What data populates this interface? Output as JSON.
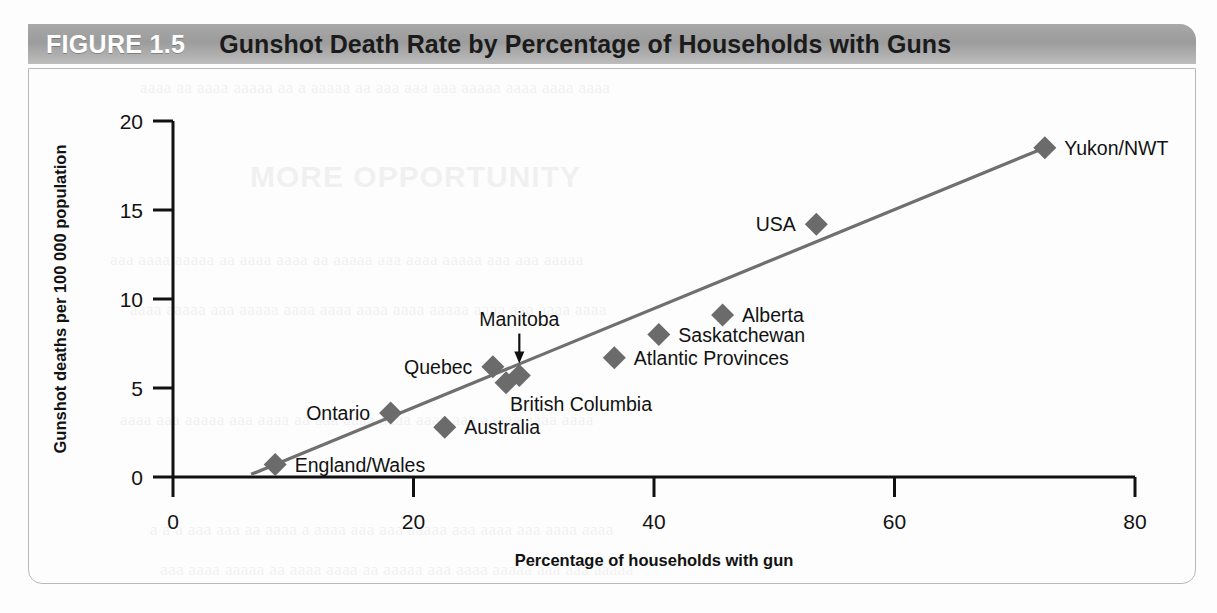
{
  "figure": {
    "number": "FIGURE 1.5",
    "title": "Gunshot Death Rate by Percentage of Households with Guns"
  },
  "colors": {
    "title_bar": "#a3a3a3",
    "figure_number_text": "#ffffff",
    "title_text": "#1b1b1b",
    "marker": "#6b6b6b",
    "trend_line": "#6f6f6f",
    "axis": "#111111",
    "panel_border": "#b9b9b9",
    "page_background": "#fdfdfd"
  },
  "chart_data": {
    "type": "scatter",
    "title": "Gunshot Death Rate by Percentage of Households with Guns",
    "xlabel": "Percentage of households with gun",
    "ylabel": "Gunshot deaths per 100 000 population",
    "xlim": [
      0,
      80
    ],
    "ylim": [
      0,
      20
    ],
    "xticks": [
      0,
      20,
      40,
      60,
      80
    ],
    "yticks": [
      0,
      5,
      10,
      15,
      20
    ],
    "xtick_labels": [
      "0",
      "20",
      "40",
      "60",
      "80"
    ],
    "ytick_labels": [
      "0",
      "5",
      "10",
      "15",
      "20"
    ],
    "grid": false,
    "legend": false,
    "points": [
      {
        "label": "England/Wales",
        "x": 8.5,
        "y": 0.7,
        "label_pos": "right"
      },
      {
        "label": "Ontario",
        "x": 18.1,
        "y": 3.6,
        "label_pos": "left"
      },
      {
        "label": "Australia",
        "x": 22.6,
        "y": 2.8,
        "label_pos": "right"
      },
      {
        "label": "Quebec",
        "x": 26.6,
        "y": 6.2,
        "label_pos": "left"
      },
      {
        "label": "British Columbia",
        "x": 27.7,
        "y": 5.3,
        "label_pos": "below-right"
      },
      {
        "label": "Manitoba",
        "x": 28.8,
        "y": 5.7,
        "label_pos": "above-arrow"
      },
      {
        "label": "Atlantic Provinces",
        "x": 36.7,
        "y": 6.7,
        "label_pos": "right"
      },
      {
        "label": "Saskatchewan",
        "x": 40.4,
        "y": 8.0,
        "label_pos": "right"
      },
      {
        "label": "Alberta",
        "x": 45.7,
        "y": 9.1,
        "label_pos": "right"
      },
      {
        "label": "USA",
        "x": 53.5,
        "y": 14.2,
        "label_pos": "left"
      },
      {
        "label": "Yukon/NWT",
        "x": 72.5,
        "y": 18.5,
        "label_pos": "right"
      }
    ],
    "trend_line": {
      "x0": 6.5,
      "y0": 0.15,
      "x1": 72.5,
      "y1": 18.5
    }
  },
  "ghost_text": {
    "heading": "MORE OPPORTUNITY",
    "lines": [
      "a a a aaa aaa aa aaaa a aaaa aaa aaa aaaaa aaa aaaa aaa aaaa aaaa",
      "aaaa aa aaaa aaaaa aa a aaaaa aa aaa aaa aaa aaaaa aaaa aaaa aaaa",
      "aaa aaaa aaaaa aa aaaa aaaa aa aaaaa aaa aaaa aaaaa aaa aaa aaaaa",
      "aaaa aaaaa aaa aaaaa aaaa aaaa aaaa aaaa aaaaa aaaa aaa aaaa aaaa",
      "aaaa aaa aaaaa aaa aaaa aa aaa aaaa aaaa aaaa aaa aaaaa aaaa aaaa"
    ]
  }
}
